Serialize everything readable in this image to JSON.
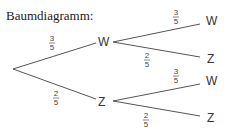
{
  "title": "Baumdiagramm:",
  "tree": {
    "root": {
      "x": 13,
      "y": 69
    },
    "level1": [
      {
        "label": "W",
        "x": 103,
        "y": 41,
        "prob_num": "3",
        "prob_den": "5"
      },
      {
        "label": "Z",
        "x": 103,
        "y": 101,
        "prob_num": "2",
        "prob_den": "5"
      }
    ],
    "level2": [
      {
        "parent": 0,
        "label": "W",
        "x": 213,
        "y": 21,
        "prob_num": "3",
        "prob_den": "5"
      },
      {
        "parent": 0,
        "label": "Z",
        "x": 213,
        "y": 58,
        "prob_num": "2",
        "prob_den": "5"
      },
      {
        "parent": 1,
        "label": "W",
        "x": 213,
        "y": 81,
        "prob_num": "3",
        "prob_den": "5"
      },
      {
        "parent": 1,
        "label": "Z",
        "x": 213,
        "y": 117,
        "prob_num": "2",
        "prob_den": "5"
      }
    ]
  },
  "colors": {
    "line": "#555555",
    "text": "#333333"
  }
}
